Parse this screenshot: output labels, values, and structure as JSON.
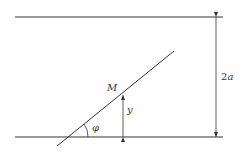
{
  "diagram": {
    "labels": {
      "point": "M",
      "height": "y",
      "angle": "φ",
      "width": "2a"
    },
    "colors": {
      "line": "#333333",
      "background": "#ffffff"
    }
  }
}
